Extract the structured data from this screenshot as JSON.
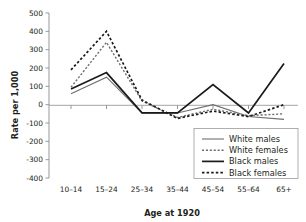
{
  "chart_data": {
    "type": "line",
    "title": "",
    "xlabel": "Age at 1920",
    "ylabel": "Rate per 1,000",
    "categories": [
      "10–14",
      "15–24",
      "25–34",
      "35–44",
      "45–54",
      "55–64",
      "65+"
    ],
    "ylim": [
      -400,
      500
    ],
    "ytick_labels": [
      "500",
      "400",
      "300",
      "200",
      "100",
      "0",
      "-100",
      "-200",
      "-300",
      "-400"
    ],
    "ytick_values": [
      500,
      400,
      300,
      200,
      100,
      0,
      -100,
      -200,
      -300,
      -400
    ],
    "grid": false,
    "legend_position": "bottom-right",
    "series": [
      {
        "name": "White males",
        "values": [
          60,
          150,
          -45,
          -45,
          0,
          -65,
          -80
        ],
        "color": "#6f6f6f",
        "style": "solid",
        "width": 1.1
      },
      {
        "name": "White females",
        "values": [
          95,
          340,
          20,
          -70,
          -25,
          -60,
          -50
        ],
        "color": "#6f6f6f",
        "style": "dashed",
        "width": 1.4
      },
      {
        "name": "Black males",
        "values": [
          85,
          175,
          -45,
          -45,
          110,
          -45,
          225
        ],
        "color": "#1a1a1a",
        "style": "solid",
        "width": 1.7
      },
      {
        "name": "Black females",
        "values": [
          190,
          400,
          25,
          -75,
          -35,
          -65,
          0
        ],
        "color": "#1a1a1a",
        "style": "dashed",
        "width": 1.7
      }
    ]
  },
  "legend": {
    "entries": [
      {
        "label": "White males"
      },
      {
        "label": "White females"
      },
      {
        "label": "Black males"
      },
      {
        "label": "Black females"
      }
    ]
  }
}
